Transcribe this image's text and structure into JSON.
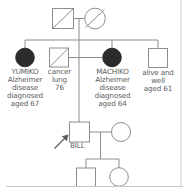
{
  "figure": {
    "type": "pedigree-chart",
    "title": "",
    "line_color": "#8d8d8d",
    "fill_affected": "#2b2b2b",
    "text_color": "#5d5d5d",
    "background": "#ffffff"
  },
  "individuals": {
    "gen1_father": {
      "symbol": "square",
      "status": "deceased",
      "affected": false,
      "label": ""
    },
    "gen1_mother": {
      "symbol": "circle",
      "status": "deceased",
      "affected": false,
      "label": ""
    },
    "yumiko": {
      "symbol": "circle",
      "status": "alive",
      "affected": true,
      "label": "YUMIKO\nAlzheimer\ndisease\ndiagnosed\naged 67"
    },
    "cancer_spouse": {
      "symbol": "square",
      "status": "deceased",
      "affected": false,
      "label": "cancer\nlung\n76"
    },
    "machiko": {
      "symbol": "circle",
      "status": "alive",
      "affected": true,
      "label": "MACHIKO\nAlzheimer\ndisease\ndiagnosed\naged 64"
    },
    "brother": {
      "symbol": "square",
      "status": "alive",
      "affected": false,
      "label": "alive and\nwell\naged 61"
    },
    "bill": {
      "symbol": "square",
      "status": "alive",
      "affected": false,
      "proband": true,
      "label": "BILL"
    },
    "bill_partner": {
      "symbol": "circle",
      "status": "alive",
      "affected": false,
      "label": ""
    },
    "child_son": {
      "symbol": "square",
      "status": "alive",
      "affected": false,
      "label": ""
    },
    "child_daughter": {
      "symbol": "circle",
      "status": "alive",
      "affected": false,
      "label": ""
    }
  },
  "annotations": {
    "proband_arrow": "proband-arrow"
  }
}
